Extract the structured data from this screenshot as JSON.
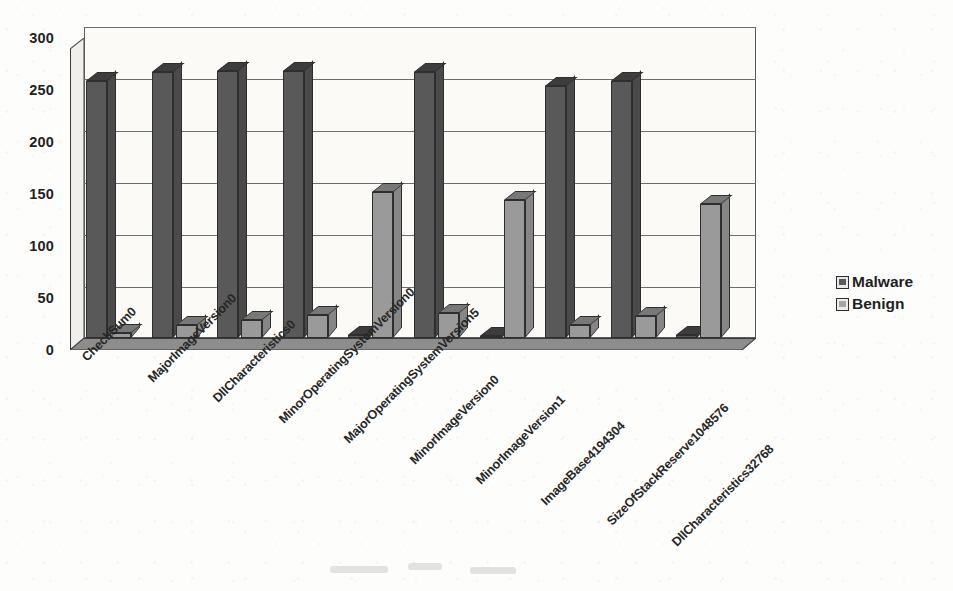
{
  "chart_data": {
    "type": "bar",
    "title": "",
    "xlabel": "",
    "ylabel": "",
    "ylim": [
      0,
      300
    ],
    "yticks": [
      0,
      50,
      100,
      150,
      200,
      250,
      300
    ],
    "grid": true,
    "legend_position": "right",
    "style": "3d-clustered-column",
    "categories": [
      "CheckSum0",
      "MajorImageVersion0",
      "DllCharacteristics0",
      "MinorOperatingSystemVersion0",
      "MajorOperatingSystemVersion5",
      "MinorImageVersion0",
      "MinorImageVersion1",
      "ImageBase4194304",
      "SizeOfStackReserve1048576",
      "DllCharacteristics32768"
    ],
    "series": [
      {
        "name": "Malware",
        "color": "#595959",
        "values": [
          257,
          266,
          267,
          267,
          3,
          266,
          2,
          252,
          257,
          3
        ]
      },
      {
        "name": "Benign",
        "color": "#9a9a9a",
        "values": [
          5,
          13,
          18,
          23,
          146,
          25,
          138,
          13,
          22,
          134
        ]
      }
    ]
  },
  "legend": {
    "items": [
      {
        "label": "Malware",
        "swatch": "malware-swatch"
      },
      {
        "label": "Benign",
        "swatch": "benign-swatch"
      }
    ]
  }
}
